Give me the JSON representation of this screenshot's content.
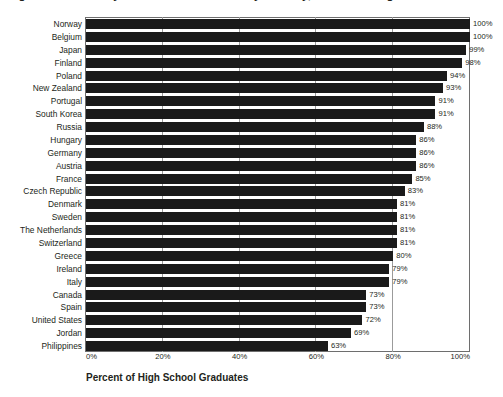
{
  "figure": {
    "title": "Figure 1. Secondary Education Attainment by Country, Percent of High School Graduates",
    "title_note": "cropped-at-top"
  },
  "chart_data": {
    "type": "bar",
    "orientation": "horizontal",
    "title": "Figure 1. Secondary Education Attainment by Country, Percent of High School Graduates",
    "xlabel": "Percent of High School Graduates",
    "ylabel": "",
    "xlim": [
      0,
      100
    ],
    "xtick_labels": [
      "0%",
      "20%",
      "40%",
      "60%",
      "80%",
      "100%"
    ],
    "xticks": [
      0,
      20,
      40,
      60,
      80,
      100
    ],
    "grid": true,
    "legend": false,
    "bar_color": "#1a1a1a",
    "value_label_suffix": "%",
    "categories": [
      "Norway",
      "Belgium",
      "Japan",
      "Finland",
      "Poland",
      "New Zealand",
      "Portugal",
      "South Korea",
      "Russia",
      "Hungary",
      "Germany",
      "Austria",
      "France",
      "Czech Republic",
      "Denmark",
      "Sweden",
      "The Netherlands",
      "Switzerland",
      "Greece",
      "Ireland",
      "Italy",
      "Canada",
      "Spain",
      "United States",
      "Jordan",
      "Philippines"
    ],
    "values": [
      100,
      100,
      99,
      98,
      94,
      93,
      91,
      91,
      88,
      86,
      86,
      86,
      85,
      83,
      81,
      81,
      81,
      81,
      80,
      79,
      79,
      73,
      73,
      72,
      69,
      63
    ],
    "value_labels": [
      "100%",
      "100%",
      "99%",
      "98%",
      "94%",
      "93%",
      "91%",
      "91%",
      "88%",
      "86%",
      "86%",
      "86%",
      "85%",
      "83%",
      "81%",
      "81%",
      "81%",
      "81%",
      "80%",
      "79%",
      "79%",
      "73%",
      "73%",
      "72%",
      "69%",
      "63%"
    ]
  }
}
